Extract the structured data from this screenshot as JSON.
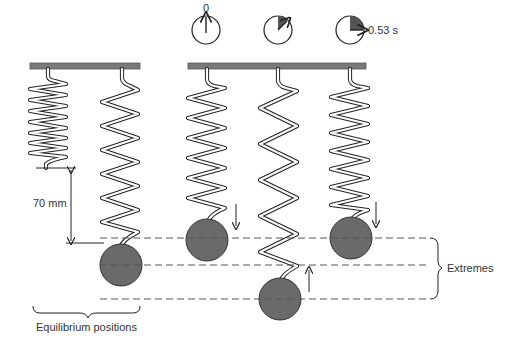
{
  "diagram": {
    "labels": {
      "extension": "70 mm",
      "equilibrium": "Equilibrium positions",
      "extremes": "Extremes"
    },
    "clocks": [
      {
        "label": "0",
        "fraction": 0
      },
      {
        "label": "",
        "fraction": 0.125
      },
      {
        "label": "0.53 s",
        "fraction": 0.25
      }
    ],
    "colors": {
      "mass": "#6a6a6a",
      "support": "#7a7a7a",
      "line": "#222222"
    }
  }
}
